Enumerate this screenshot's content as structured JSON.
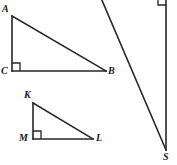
{
  "figure": {
    "canvas": {
      "width": 177,
      "height": 165
    },
    "stroke_color": "#262626",
    "background_color": "#ffffff",
    "stroke_width": 1.6
  },
  "shapes": {
    "triangle_abc": {
      "name": "triangle-abc",
      "vertices": {
        "A": {
          "x": 12,
          "y": 16,
          "label": "A",
          "label_x": 2,
          "label_y": 4
        },
        "C": {
          "x": 12,
          "y": 71,
          "label": "C",
          "label_x": 1,
          "label_y": 67
        },
        "B": {
          "x": 106,
          "y": 71,
          "label": "B",
          "label_x": 108,
          "label_y": 67
        }
      },
      "right_angle_at": "C",
      "right_angle_mark": {
        "x": 12,
        "y": 63,
        "size": 8
      }
    },
    "triangle_kml": {
      "name": "triangle-kml",
      "vertices": {
        "K": {
          "x": 33,
          "y": 103,
          "label": "K",
          "label_x": 24,
          "label_y": 91
        },
        "M": {
          "x": 33,
          "y": 139,
          "label": "M",
          "label_x": 20,
          "label_y": 134
        },
        "L": {
          "x": 93,
          "y": 139,
          "label": "L",
          "label_x": 96,
          "label_y": 134
        }
      },
      "right_angle_at": "M",
      "right_angle_mark": {
        "x": 33,
        "y": 131,
        "size": 8
      }
    },
    "triangle_partial_s": {
      "name": "triangle-partial-s",
      "description": "Partially visible right triangle at right edge; only hypotenuse, vertical leg and vertex S are in frame",
      "vertices": {
        "S": {
          "x": 166,
          "y": 150,
          "label": "S",
          "label_x": 164,
          "label_y": 153
        }
      },
      "hypotenuse": {
        "x1": 101,
        "y1": 0,
        "x2": 166,
        "y2": 150
      },
      "vertical_leg": {
        "x1": 166,
        "y1": 0,
        "x2": 166,
        "y2": 150
      },
      "right_angle_mark": {
        "x": 158,
        "y": 0,
        "size": 8,
        "at": "top-right-offscreen-vertex"
      }
    }
  },
  "labels": {
    "A": "A",
    "B": "B",
    "C": "C",
    "K": "K",
    "L": "L",
    "M": "M",
    "S": "S"
  }
}
